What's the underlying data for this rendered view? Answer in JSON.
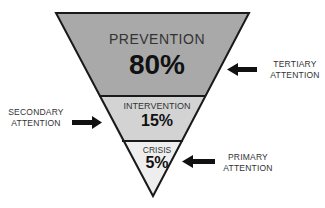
{
  "diagram": {
    "type": "inverted-pyramid",
    "tiers": [
      {
        "title": "PREVENTION",
        "percent": "80%",
        "fill": "#a9a9a9",
        "attention": "TERTIARY ATTENTION",
        "attention_line1": "TERTIARY",
        "attention_line2": "ATTENTION",
        "arrow_direction": "left"
      },
      {
        "title": "INTERVENTION",
        "percent": "15%",
        "fill": "#d3d3d3",
        "attention": "SECONDARY ATTENTION",
        "attention_line1": "SECONDARY",
        "attention_line2": "ATTENTION",
        "arrow_direction": "right"
      },
      {
        "title": "CRISIS",
        "percent": "5%",
        "fill": "#eeeeee",
        "attention": "PRIMARY ATTENTION",
        "attention_line1": "PRIMARY",
        "attention_line2": "ATTENTION",
        "arrow_direction": "left"
      }
    ],
    "colors": {
      "outline": "#1a1a1a",
      "arrow": "#111111",
      "text": "#333333"
    }
  }
}
